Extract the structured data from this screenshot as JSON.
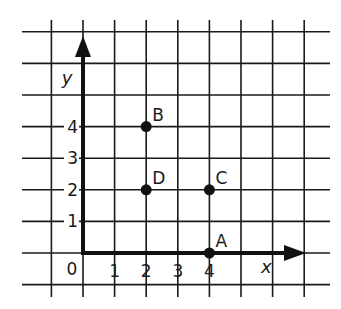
{
  "diagram": {
    "type": "coordinate-grid",
    "colors": {
      "background": "#ffffff",
      "grid": "#1a1a1a",
      "axis": "#111111",
      "point": "#111111"
    },
    "axes": {
      "x_label": "x",
      "y_label": "y",
      "origin_label": "0",
      "x_ticks": [
        "1",
        "2",
        "3",
        "4"
      ],
      "y_ticks": [
        "1",
        "2",
        "3",
        "4"
      ]
    },
    "points": [
      {
        "name": "A",
        "x": 4,
        "y": 0
      },
      {
        "name": "B",
        "x": 2,
        "y": 4
      },
      {
        "name": "C",
        "x": 4,
        "y": 2
      },
      {
        "name": "D",
        "x": 2,
        "y": 2
      }
    ]
  },
  "chart_data": {
    "type": "scatter",
    "title": "",
    "xlabel": "x",
    "ylabel": "y",
    "points": [
      {
        "label": "A",
        "x": 4,
        "y": 0
      },
      {
        "label": "B",
        "x": 2,
        "y": 4
      },
      {
        "label": "C",
        "x": 4,
        "y": 2
      },
      {
        "label": "D",
        "x": 2,
        "y": 2
      }
    ],
    "x_ticks": [
      0,
      1,
      2,
      3,
      4
    ],
    "y_ticks": [
      1,
      2,
      3,
      4
    ],
    "xlim": [
      -1,
      7
    ],
    "ylim": [
      -1,
      7
    ],
    "grid": true
  }
}
